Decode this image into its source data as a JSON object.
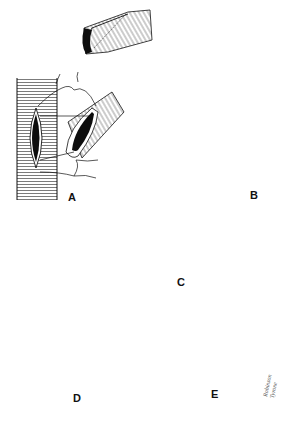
{
  "figure": {
    "type": "surgical illustration",
    "colors": {
      "ink": "#111111",
      "background": "#ffffff",
      "lumen": "#0d0d0d"
    },
    "panels": [
      {
        "id": "A",
        "label": "A",
        "label_pos": [
          68,
          192
        ]
      },
      {
        "id": "B",
        "label": "B",
        "label_pos": [
          250,
          190
        ]
      },
      {
        "id": "C",
        "label": "C",
        "label_pos": [
          177,
          277
        ]
      },
      {
        "id": "D",
        "label": "D",
        "label_pos": [
          73,
          393
        ]
      },
      {
        "id": "E",
        "label": "E",
        "label_pos": [
          211,
          389
        ]
      }
    ],
    "signature": {
      "line1": "Robinson",
      "line2": "Tyrone"
    }
  }
}
